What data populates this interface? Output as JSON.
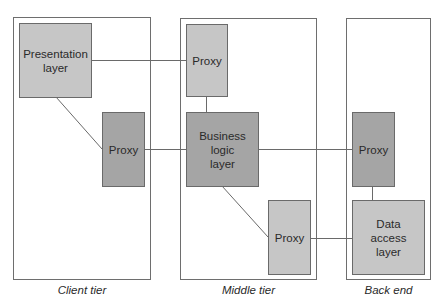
{
  "colors": {
    "light_box": "#c6c6c6",
    "dark_box": "#a5a5a5",
    "line": "#6a6a6a"
  },
  "tiers": [
    {
      "id": "client",
      "label": "Client tier"
    },
    {
      "id": "middle",
      "label": "Middle tier"
    },
    {
      "id": "backend",
      "label": "Back end"
    }
  ],
  "nodes": {
    "presentation_layer": {
      "label": "Presentation\nlayer",
      "tier": "client",
      "shade": "light"
    },
    "client_proxy": {
      "label": "Proxy",
      "tier": "client",
      "shade": "dark"
    },
    "middle_top_proxy": {
      "label": "Proxy",
      "tier": "middle",
      "shade": "light"
    },
    "business_logic_layer": {
      "label": "Business\nlogic\nlayer",
      "tier": "middle",
      "shade": "dark"
    },
    "middle_bottom_proxy": {
      "label": "Proxy",
      "tier": "middle",
      "shade": "light"
    },
    "backend_proxy": {
      "label": "Proxy",
      "tier": "backend",
      "shade": "dark"
    },
    "data_access_layer": {
      "label": "Data\naccess\nlayer",
      "tier": "backend",
      "shade": "light"
    }
  },
  "edges": [
    {
      "from": "presentation_layer",
      "to": "middle_top_proxy"
    },
    {
      "from": "presentation_layer",
      "to": "client_proxy"
    },
    {
      "from": "client_proxy",
      "to": "business_logic_layer"
    },
    {
      "from": "middle_top_proxy",
      "to": "business_logic_layer"
    },
    {
      "from": "business_logic_layer",
      "to": "backend_proxy"
    },
    {
      "from": "business_logic_layer",
      "to": "middle_bottom_proxy"
    },
    {
      "from": "middle_bottom_proxy",
      "to": "data_access_layer"
    },
    {
      "from": "backend_proxy",
      "to": "data_access_layer"
    }
  ]
}
